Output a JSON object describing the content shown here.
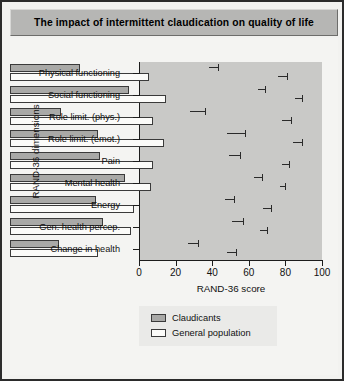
{
  "title": "The impact of intermittent claudication on quality of life",
  "chart_data": {
    "type": "bar",
    "orientation": "horizontal",
    "title": "The impact of intermittent claudication on quality of life",
    "xlabel": "RAND-36 score",
    "ylabel": "RAND-36 dimensions",
    "xlim": [
      0,
      100
    ],
    "xticks": [
      "0",
      "20",
      "40",
      "60",
      "80",
      "100"
    ],
    "grid": false,
    "legend_position": "bottom-center",
    "categories": [
      "Physical functioning",
      "Social functioning",
      "Role limit. (phys.)",
      "Role limit. (emot.)",
      "Pain",
      "Mental health",
      "Energy",
      "Gen. health percep.",
      "Change in health"
    ],
    "series": [
      {
        "name": "Claudicants",
        "color": "#a9a9a7",
        "values": [
          38,
          65,
          28,
          48,
          49,
          63,
          47,
          51,
          27
        ],
        "errors": [
          5,
          4,
          8,
          10,
          6,
          4,
          5,
          6,
          5
        ]
      },
      {
        "name": "General population",
        "color": "#fbfbf9",
        "values": [
          76,
          85,
          78,
          84,
          78,
          77,
          68,
          66,
          48
        ],
        "errors": [
          5,
          4,
          5,
          5,
          4,
          3,
          4,
          4,
          5
        ]
      }
    ]
  }
}
